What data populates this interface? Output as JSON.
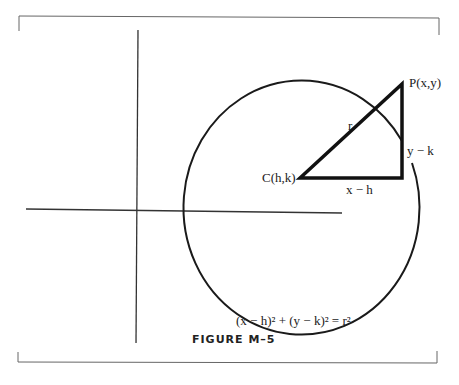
{
  "figure": {
    "caption": "FIGURE M–5",
    "equation": "(x − h)² + (y − k)² = r²",
    "labels": {
      "point_p": "P(x,y)",
      "center_c": "C(h,k)",
      "radius": "r",
      "horizontal_leg": "x − h",
      "vertical_leg": "y − k"
    }
  },
  "style": {
    "line_color": "#1a1a1a",
    "frame_color": "#555555"
  }
}
